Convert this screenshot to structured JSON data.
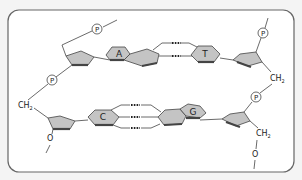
{
  "diagram": {
    "top_strand": {
      "bases": [
        {
          "label": "A",
          "name": "adenine"
        },
        {
          "label": "T",
          "name": "thymine"
        }
      ],
      "phosphates": [
        "P",
        "P",
        "P"
      ],
      "groups": [
        "CH2"
      ]
    },
    "bottom_strand": {
      "bases": [
        {
          "label": "C",
          "name": "cytosine"
        },
        {
          "label": "G",
          "name": "guanine"
        }
      ],
      "phosphates": [
        "P"
      ],
      "groups": [
        "CH2",
        "O",
        "CH2",
        "O"
      ]
    },
    "labels": {
      "phosphate": "P",
      "base_a": "A",
      "base_t": "T",
      "base_c": "C",
      "base_g": "G",
      "ch": "CH",
      "sub2": "2",
      "oxygen": "O"
    },
    "hydrogen_bonds": {
      "A_T": 2,
      "C_G": 3
    },
    "colors": {
      "ring_fill": "#c4c4c4",
      "line": "#444444",
      "frame_border": "#666666",
      "background": "#f4f4f4"
    }
  }
}
